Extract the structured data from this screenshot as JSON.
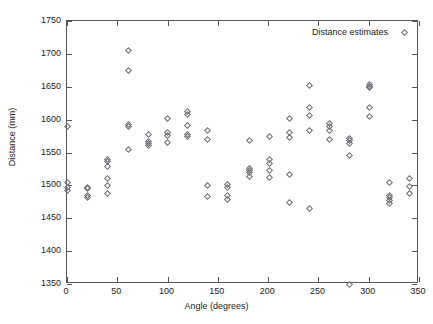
{
  "chart_data": {
    "type": "scatter",
    "title": "",
    "xlabel": "Angle (degrees)",
    "ylabel": "Distance (mm)",
    "xlim": [
      0,
      350
    ],
    "ylim": [
      1350,
      1750
    ],
    "xticks": [
      0,
      50,
      100,
      150,
      200,
      250,
      300,
      350
    ],
    "yticks": [
      1350,
      1400,
      1450,
      1500,
      1550,
      1600,
      1650,
      1700,
      1750
    ],
    "grid": false,
    "legend_position": "top-right-inside",
    "marker": "open-diamond",
    "marker_color": "#6d6e72",
    "series": [
      {
        "name": "Distance estimates",
        "points": [
          [
            0,
            1504
          ],
          [
            0,
            1497
          ],
          [
            0,
            1492
          ],
          [
            0,
            1589
          ],
          [
            20,
            1497
          ],
          [
            20,
            1495
          ],
          [
            20,
            1484
          ],
          [
            20,
            1481
          ],
          [
            40,
            1540
          ],
          [
            40,
            1536
          ],
          [
            40,
            1529
          ],
          [
            40,
            1511
          ],
          [
            40,
            1500
          ],
          [
            40,
            1488
          ],
          [
            61,
            1705
          ],
          [
            61,
            1675
          ],
          [
            61,
            1592
          ],
          [
            61,
            1590
          ],
          [
            61,
            1555
          ],
          [
            81,
            1577
          ],
          [
            81,
            1566
          ],
          [
            81,
            1563
          ],
          [
            81,
            1560
          ],
          [
            100,
            1602
          ],
          [
            100,
            1580
          ],
          [
            100,
            1576
          ],
          [
            100,
            1565
          ],
          [
            120,
            1613
          ],
          [
            120,
            1608
          ],
          [
            120,
            1591
          ],
          [
            120,
            1578
          ],
          [
            120,
            1575
          ],
          [
            140,
            1583
          ],
          [
            140,
            1570
          ],
          [
            140,
            1500
          ],
          [
            140,
            1483
          ],
          [
            160,
            1501
          ],
          [
            160,
            1497
          ],
          [
            160,
            1484
          ],
          [
            160,
            1479
          ],
          [
            181,
            1568
          ],
          [
            181,
            1526
          ],
          [
            181,
            1523
          ],
          [
            181,
            1519
          ],
          [
            181,
            1514
          ],
          [
            201,
            1574
          ],
          [
            201,
            1540
          ],
          [
            201,
            1534
          ],
          [
            201,
            1522
          ],
          [
            201,
            1512
          ],
          [
            221,
            1601
          ],
          [
            221,
            1580
          ],
          [
            221,
            1573
          ],
          [
            221,
            1516
          ],
          [
            221,
            1474
          ],
          [
            241,
            1652
          ],
          [
            241,
            1618
          ],
          [
            241,
            1606
          ],
          [
            241,
            1583
          ],
          [
            241,
            1465
          ],
          [
            261,
            1594
          ],
          [
            261,
            1589
          ],
          [
            261,
            1583
          ],
          [
            261,
            1570
          ],
          [
            281,
            1572
          ],
          [
            281,
            1568
          ],
          [
            281,
            1563
          ],
          [
            281,
            1546
          ],
          [
            281,
            1350
          ],
          [
            301,
            1653
          ],
          [
            301,
            1651
          ],
          [
            301,
            1649
          ],
          [
            301,
            1619
          ],
          [
            301,
            1604
          ],
          [
            321,
            1504
          ],
          [
            321,
            1484
          ],
          [
            321,
            1482
          ],
          [
            321,
            1477
          ],
          [
            321,
            1472
          ],
          [
            341,
            1511
          ],
          [
            341,
            1499
          ],
          [
            341,
            1487
          ]
        ]
      }
    ]
  }
}
